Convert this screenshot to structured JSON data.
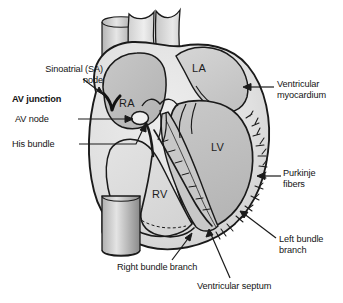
{
  "figure": {
    "background_color": "#ffffff",
    "line_color": "#1a1a1a"
  },
  "chambers": [
    {
      "id": "la",
      "label": "LA",
      "name": "left atrium",
      "x": 192,
      "y": 62
    },
    {
      "id": "ra",
      "label": "RA",
      "name": "right atrium",
      "x": 119,
      "y": 97
    },
    {
      "id": "lv",
      "label": "LV",
      "name": "left ventricle",
      "x": 211,
      "y": 141
    },
    {
      "id": "rv",
      "label": "RV",
      "name": "right ventricle",
      "x": 152,
      "y": 188
    }
  ],
  "labels": [
    {
      "id": "sa-node",
      "text": "Sinoatrial (SA)\nnode",
      "align": "right",
      "bold": false,
      "x": 10,
      "y": 64,
      "width": 93
    },
    {
      "id": "av-junction",
      "text": "AV junction",
      "align": "left",
      "bold": true,
      "x": 12,
      "y": 94,
      "width": 93
    },
    {
      "id": "av-node",
      "text": "AV node",
      "align": "left",
      "bold": false,
      "x": 15,
      "y": 115,
      "width": 60
    },
    {
      "id": "his-bundle",
      "text": "His bundle",
      "align": "left",
      "bold": false,
      "x": 12,
      "y": 140,
      "width": 66
    },
    {
      "id": "ventricular-myocardium",
      "text": "Ventricular\nmyocardium",
      "align": "left",
      "bold": false,
      "x": 277,
      "y": 79,
      "width": 70
    },
    {
      "id": "purkinje-fibers",
      "text": "Purkinje\nfibers",
      "align": "left",
      "bold": false,
      "x": 283,
      "y": 168,
      "width": 60
    },
    {
      "id": "left-bundle-branch",
      "text": "Left bundle\nbranch",
      "align": "left",
      "bold": false,
      "x": 279,
      "y": 234,
      "width": 66
    },
    {
      "id": "right-bundle-branch",
      "text": "Right bundle branch",
      "align": "left",
      "bold": false,
      "x": 117,
      "y": 264,
      "width": 115
    },
    {
      "id": "ventricular-septum",
      "text": "Ventricular septum",
      "align": "left",
      "bold": false,
      "x": 197,
      "y": 282,
      "width": 112
    }
  ],
  "structures": [
    {
      "id": "svc",
      "name": "superior vena cava"
    },
    {
      "id": "ivc",
      "name": "inferior vena cava"
    },
    {
      "id": "aorta",
      "name": "aorta"
    },
    {
      "id": "pulmonary-artery",
      "name": "pulmonary artery"
    },
    {
      "id": "sa-node-marker",
      "name": "sinoatrial node"
    },
    {
      "id": "av-node-marker",
      "name": "atrioventricular node"
    },
    {
      "id": "his-bundle-path",
      "name": "bundle of His"
    },
    {
      "id": "left-bundle-path",
      "name": "left bundle branch"
    },
    {
      "id": "right-bundle-path",
      "name": "right bundle branch"
    },
    {
      "id": "purkinje-network",
      "name": "purkinje fiber network"
    },
    {
      "id": "interventricular-septum",
      "name": "interventricular septum"
    },
    {
      "id": "tricuspid-valve",
      "name": "tricuspid valve"
    },
    {
      "id": "mitral-valve",
      "name": "mitral valve"
    }
  ],
  "colors": {
    "outline": "#1a1a1a",
    "myocardium_light": "#e4e4e4",
    "myocardium_mid": "#cfcfcf",
    "chamber_fill": "#bdbdbd",
    "septum_fill": "#c8c8c8",
    "vessel_light": "#dcdcdc",
    "vessel_dark": "#9a9a9a",
    "sa_node": "#111111",
    "av_node": "#efefef"
  }
}
